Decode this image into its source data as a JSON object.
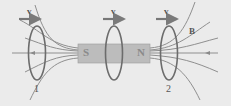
{
  "diagram": {
    "magnet": {
      "south_label": "S",
      "north_label": "N",
      "color": "#b9b9b9"
    },
    "velocity_labels": [
      "v",
      "v",
      "v"
    ],
    "field_label": "B",
    "loop_labels": [
      "1",
      "2"
    ],
    "colors": {
      "background": "#ebebeb",
      "field_lines": "#8a8a8a",
      "loops": "#6e6e6e",
      "arrows": "#707070"
    }
  }
}
